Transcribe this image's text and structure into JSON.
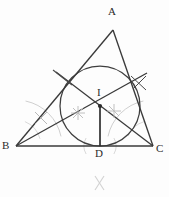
{
  "figure": {
    "type": "euclidean-geometry-construction",
    "canvas": {
      "width": 169,
      "height": 197
    },
    "colors": {
      "primary_stroke": "#3a3a3a",
      "construction_stroke": "#8f8f8f",
      "faint_stroke": "#c4c4c4",
      "label_color": "#2b2b2b",
      "background": "#fdfdfd"
    },
    "points": [
      {
        "name": "A",
        "label": "A",
        "x": 113,
        "y": 30,
        "label_x": 110,
        "label_y": 12,
        "role": "apex-vertex"
      },
      {
        "name": "B",
        "label": "B",
        "x": 16,
        "y": 146,
        "label_x": 3,
        "label_y": 146,
        "role": "left-base-vertex"
      },
      {
        "name": "C",
        "label": "C",
        "x": 153,
        "y": 146,
        "label_x": 156,
        "label_y": 148,
        "role": "right-base-vertex"
      },
      {
        "name": "I",
        "label": "I",
        "x": 100,
        "y": 106,
        "label_x": 97,
        "label_y": 88,
        "role": "incenter"
      },
      {
        "name": "D",
        "label": "D",
        "x": 100,
        "y": 146,
        "label_x": 96,
        "label_y": 150,
        "role": "foot-of-perpendicular"
      }
    ],
    "triangle": {
      "sides": [
        {
          "name": "side-AB",
          "from": "A",
          "to": "B"
        },
        {
          "name": "side-AC",
          "from": "A",
          "to": "C"
        },
        {
          "name": "side-BC",
          "from": "B",
          "to": "C"
        }
      ]
    },
    "incircle": {
      "center_x": 100,
      "center_y": 106,
      "radius": 40,
      "label": "inscribed circle"
    },
    "segments": [
      {
        "name": "bisector-from-B",
        "x1": 16,
        "y1": 146,
        "x2": 147,
        "y2": 73,
        "kind": "angle-bisector"
      },
      {
        "name": "bisector-from-C",
        "x1": 153,
        "y1": 146,
        "x2": 56,
        "y2": 72,
        "kind": "angle-bisector"
      },
      {
        "name": "inradius-ID",
        "x1": 100,
        "y1": 106,
        "x2": 100,
        "y2": 146,
        "kind": "inradius-perpendicular"
      }
    ],
    "construction_arcs": [
      {
        "name": "arc-at-B-large",
        "cx": 16,
        "cy": 146,
        "r": 46,
        "start_deg": -78,
        "end_deg": -12
      },
      {
        "name": "arc-at-C-large",
        "cx": 153,
        "cy": 146,
        "r": 46,
        "start_deg": 192,
        "end_deg": 258
      },
      {
        "name": "arc-at-B-small",
        "cx": 16,
        "cy": 146,
        "r": 26,
        "start_deg": -70,
        "end_deg": -16
      },
      {
        "name": "arc-at-C-small",
        "cx": 153,
        "cy": 146,
        "r": 26,
        "start_deg": 196,
        "end_deg": 250
      },
      {
        "name": "arc-at-D-left",
        "cx": 100,
        "cy": 146,
        "r": 16,
        "start_deg": 150,
        "end_deg": 210
      },
      {
        "name": "arc-at-D-right",
        "cx": 100,
        "cy": 146,
        "r": 16,
        "start_deg": -30,
        "end_deg": 30
      }
    ],
    "tick_crosses": [
      {
        "name": "cross-left-of-incenter",
        "x": 78,
        "y": 113
      },
      {
        "name": "cross-right-of-incenter",
        "x": 114,
        "y": 111
      },
      {
        "name": "cross-on-side-AB",
        "x": 41,
        "y": 118
      },
      {
        "name": "cross-upper-left-AB",
        "x": 62,
        "y": 77
      },
      {
        "name": "cross-upper-right-AC",
        "x": 140,
        "y": 82
      }
    ],
    "stray_marks": [
      {
        "name": "stray-x-mark-bottom",
        "glyph": "X",
        "x": 94,
        "y": 176
      }
    ]
  }
}
